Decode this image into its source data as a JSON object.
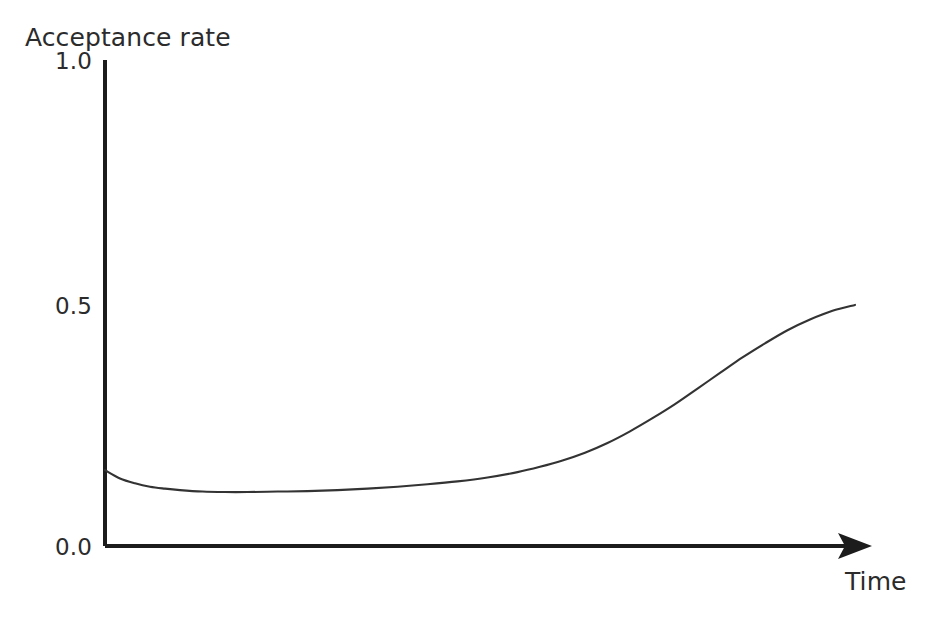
{
  "chart_data": {
    "type": "line",
    "title": "",
    "xlabel": "Time",
    "ylabel": "Acceptance rate",
    "ylim": [
      0.0,
      1.0
    ],
    "xlim": [
      0,
      100
    ],
    "grid": false,
    "legend": null,
    "y_ticks": [
      "0.0",
      "0.5",
      "1.0"
    ],
    "y_tick_values": [
      0.0,
      0.5,
      1.0
    ],
    "x_ticks": [],
    "axis_style": "open-l-shape-with-x-arrow",
    "annotations": [],
    "series": [
      {
        "name": "Acceptance rate",
        "color": "#333333",
        "x": [
          0,
          2,
          4,
          6,
          8,
          10,
          13,
          16,
          19,
          23,
          27,
          31,
          35,
          39,
          43,
          47,
          51,
          55,
          58,
          61,
          64,
          67,
          70,
          73,
          76,
          79,
          82,
          85,
          88,
          91,
          94,
          97,
          100
        ],
        "values": [
          0.156,
          0.139,
          0.129,
          0.122,
          0.118,
          0.115,
          0.112,
          0.111,
          0.111,
          0.112,
          0.113,
          0.115,
          0.118,
          0.122,
          0.127,
          0.133,
          0.141,
          0.152,
          0.163,
          0.176,
          0.192,
          0.212,
          0.236,
          0.263,
          0.292,
          0.324,
          0.356,
          0.388,
          0.417,
          0.444,
          0.466,
          0.484,
          0.496
        ]
      }
    ]
  },
  "labels": {
    "y_axis_title": "Acceptance rate",
    "x_axis_title": "Time",
    "y_top": "1.0",
    "y_mid": "0.5",
    "y_bottom": "0.0"
  },
  "colors": {
    "background": "#ffffff",
    "axis": "#1c1c1c",
    "curve": "#333333",
    "text": "#2b2b2b"
  }
}
